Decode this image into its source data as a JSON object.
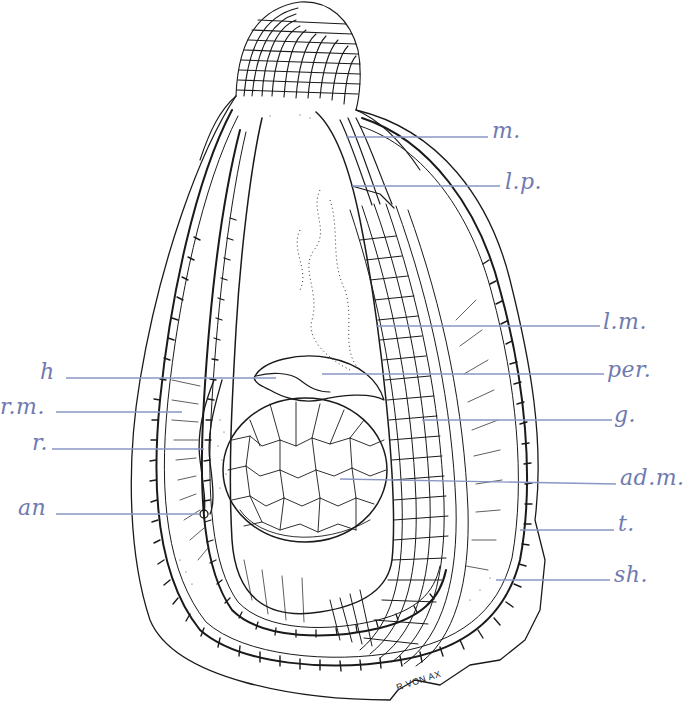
{
  "figure": {
    "style": "pen-and-ink line drawing with blue hand-lettered labels",
    "label_color": "#6f7ab0",
    "leader_color": "#8a96c4",
    "ink_color": "#1a1a1a",
    "signature": "R VON AX"
  },
  "labels": {
    "right": [
      {
        "id": "m",
        "text": "m.",
        "x": 492,
        "y": 120
      },
      {
        "id": "lp",
        "text": "l.p.",
        "x": 505,
        "y": 173
      },
      {
        "id": "lm",
        "text": "l.m.",
        "x": 603,
        "y": 313
      },
      {
        "id": "per",
        "text": "per.",
        "x": 607,
        "y": 362
      },
      {
        "id": "g",
        "text": "g.",
        "x": 614,
        "y": 407
      },
      {
        "id": "adm",
        "text": "ad.m.",
        "x": 620,
        "y": 468
      },
      {
        "id": "t",
        "text": "t.",
        "x": 618,
        "y": 513
      },
      {
        "id": "sh",
        "text": "sh.",
        "x": 614,
        "y": 565
      }
    ],
    "left": [
      {
        "id": "h",
        "text": "h",
        "x": 40,
        "y": 362
      },
      {
        "id": "rm",
        "text": "r.m.",
        "x": 0,
        "y": 398
      },
      {
        "id": "r",
        "text": "r.",
        "x": 32,
        "y": 433
      },
      {
        "id": "an",
        "text": "an",
        "x": 18,
        "y": 498
      }
    ]
  },
  "legend_meaning": {
    "m.": "mouth",
    "l.p.": "labial palps",
    "l.m.": "mantle",
    "per.": "pericardium",
    "g.": "gills",
    "ad.m.": "adductor muscle",
    "t.": "tentacles",
    "sh.": "shell",
    "h": "heart",
    "r.m.": "right mantle",
    "r.": "rectum",
    "an": "anus"
  }
}
